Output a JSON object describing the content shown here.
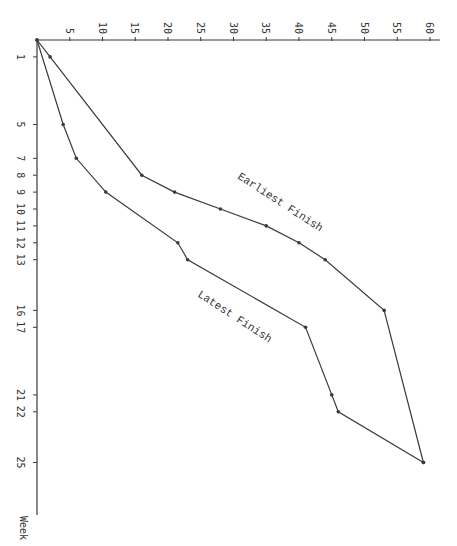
{
  "chart_data": {
    "type": "line",
    "title": "",
    "orientation": "rotated-90 (weeks run downward along left axis, values run rightward along top axis)",
    "xlabel": "Week",
    "ylabel": "",
    "week_ticks": [
      1,
      5,
      7,
      8,
      9,
      10,
      11,
      12,
      13,
      16,
      17,
      21,
      22,
      25
    ],
    "value_ticks": [
      5,
      10,
      15,
      20,
      25,
      30,
      35,
      40,
      45,
      50,
      55,
      60
    ],
    "ylim": [
      0,
      60
    ],
    "xlim": [
      0,
      28
    ],
    "grid": false,
    "legend": "inline labels",
    "series": [
      {
        "name": "Earliest Finish",
        "points": [
          [
            0,
            0
          ],
          [
            1,
            2
          ],
          [
            8,
            16
          ],
          [
            9,
            21
          ],
          [
            10,
            28
          ],
          [
            11,
            35
          ],
          [
            12,
            40
          ],
          [
            13,
            44
          ],
          [
            16,
            53
          ],
          [
            25,
            59
          ]
        ]
      },
      {
        "name": "Latest Finish",
        "points": [
          [
            0,
            0
          ],
          [
            5,
            4
          ],
          [
            7,
            6
          ],
          [
            9,
            10.5
          ],
          [
            12,
            21.5
          ],
          [
            13,
            23
          ],
          [
            17,
            41
          ],
          [
            21,
            45
          ],
          [
            22,
            46
          ],
          [
            25,
            59
          ]
        ]
      }
    ]
  },
  "labels": {
    "week_axis": "Week",
    "earliest": "Earliest Finish",
    "latest": "Latest Finish"
  }
}
